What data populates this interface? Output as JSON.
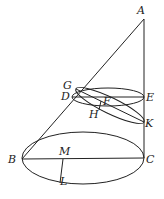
{
  "diagram": {
    "type": "geometry-cone-sections",
    "labels": {
      "A": "A",
      "B": "B",
      "C": "C",
      "D": "D",
      "E": "E",
      "F": "F",
      "G": "G",
      "H": "H",
      "K": "K",
      "L": "L",
      "M": "M"
    },
    "points": {
      "A": [
        144,
        19
      ],
      "B": [
        22,
        159
      ],
      "C": [
        144,
        158
      ],
      "D": [
        72,
        97
      ],
      "E": [
        144,
        97
      ],
      "F": [
        101,
        101
      ],
      "G": [
        76,
        89
      ],
      "H": [
        99,
        110
      ],
      "K": [
        144,
        122
      ],
      "M": [
        63,
        159
      ],
      "L": [
        60,
        183
      ]
    },
    "stroke_color": "#222222"
  }
}
